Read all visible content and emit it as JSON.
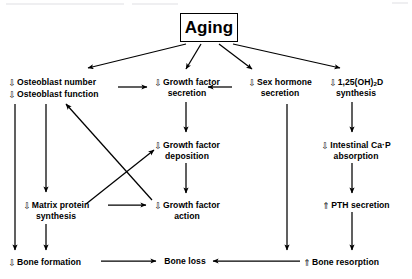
{
  "figure": {
    "title": "Aging",
    "type": "flow-diagram",
    "orientation": "top-down"
  },
  "nodes": {
    "aging": {
      "label": "Aging"
    },
    "osteoblast": {
      "line1_change": "⇩",
      "line1": "Osteoblast  number",
      "line2_change": "⇩",
      "line2": "Osteoblast  function"
    },
    "gf_secretion": {
      "change": "⇩",
      "line1": "Growth  factor",
      "line2": "secretion"
    },
    "sex_hormone": {
      "change": "⇩",
      "line1": "Sex  hormone",
      "line2": "secretion"
    },
    "vitd": {
      "change": "⇩",
      "line1_a": "1,25(OH)",
      "line1_sub": "2",
      "line1_b": "D",
      "line2": "synthesis"
    },
    "gf_deposition": {
      "change": "⇩",
      "line1": "Growth  factor",
      "line2": "deposition"
    },
    "intestinal": {
      "change": "⇩",
      "line1": "Intestinal  Ca·P",
      "line2": "absorption"
    },
    "matrix_protein": {
      "change": "⇩",
      "line1": "Matrix  protein",
      "line2": "synthesis"
    },
    "gf_action": {
      "change": "⇩",
      "line1": "Growth  factor",
      "line2": "action"
    },
    "pth": {
      "change": "⇑",
      "line1": "PTH  secretion"
    },
    "bone_formation": {
      "change": "⇩",
      "line1": "Bone  formation"
    },
    "bone_loss": {
      "line1": "Bone  loss"
    },
    "bone_resorption": {
      "change": "⇑",
      "line1": "Bone  resorption"
    }
  },
  "edges": [
    {
      "from": "aging",
      "to": "osteoblast",
      "style": "arrow"
    },
    {
      "from": "aging",
      "to": "gf_secretion",
      "style": "arrow"
    },
    {
      "from": "aging",
      "to": "sex_hormone",
      "style": "arrow"
    },
    {
      "from": "aging",
      "to": "vitd",
      "style": "arrow"
    },
    {
      "from": "osteoblast",
      "to": "gf_secretion",
      "style": "arrow"
    },
    {
      "from": "sex_hormone",
      "to": "gf_secretion",
      "style": "arrow"
    },
    {
      "from": "gf_secretion",
      "to": "gf_deposition",
      "style": "arrow"
    },
    {
      "from": "gf_deposition",
      "to": "gf_action",
      "style": "arrow"
    },
    {
      "from": "osteoblast",
      "to": "matrix_protein",
      "style": "arrow"
    },
    {
      "from": "osteoblast",
      "to": "bone_formation",
      "style": "arrow"
    },
    {
      "from": "matrix_protein",
      "to": "gf_action",
      "style": "arrow"
    },
    {
      "from": "matrix_protein",
      "to": "gf_deposition",
      "style": "arrow-cross"
    },
    {
      "from": "gf_action",
      "to": "osteoblast",
      "style": "arrow-cross"
    },
    {
      "from": "matrix_protein",
      "to": "bone_formation",
      "style": "arrow"
    },
    {
      "from": "vitd",
      "to": "intestinal",
      "style": "arrow"
    },
    {
      "from": "intestinal",
      "to": "pth",
      "style": "arrow"
    },
    {
      "from": "pth",
      "to": "bone_resorption",
      "style": "arrow"
    },
    {
      "from": "sex_hormone",
      "to": "bone_resorption",
      "style": "arrow"
    },
    {
      "from": "bone_formation",
      "to": "bone_loss",
      "style": "arrow"
    },
    {
      "from": "bone_resorption",
      "to": "bone_loss",
      "style": "arrow"
    }
  ],
  "colors": {
    "ink": "#000000",
    "page": "#ffffff",
    "artifact": "#e9e9ec"
  }
}
